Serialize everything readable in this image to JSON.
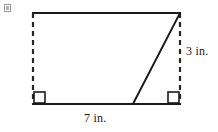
{
  "figure": {
    "background_color": "#ffffff",
    "stroke_color": "#1a1a1a",
    "dashed_stroke_color": "#262626",
    "labels": {
      "height": "3 in.",
      "base": "7 in."
    },
    "right_angle_markers": [
      {
        "name": "bottom-left-right-angle",
        "x": 33,
        "y": 104
      },
      {
        "name": "bottom-right-right-angle",
        "x": 180,
        "y": 104
      }
    ],
    "vertices": {
      "top_left": {
        "x": 33,
        "y": 13
      },
      "top_right": {
        "x": 180,
        "y": 13
      },
      "bottom_left": {
        "x": 33,
        "y": 104
      },
      "bottom_right": {
        "x": 180,
        "y": 104
      },
      "diagonal_foot": {
        "x": 133,
        "y": 104
      }
    },
    "edges": [
      {
        "name": "top-edge",
        "style": "solid"
      },
      {
        "name": "bottom-edge",
        "style": "solid"
      },
      {
        "name": "left-edge",
        "style": "dashed"
      },
      {
        "name": "right-edge",
        "style": "dashed"
      },
      {
        "name": "slant-edge",
        "style": "solid"
      }
    ],
    "placeholder_icon": "broken-image-icon"
  }
}
